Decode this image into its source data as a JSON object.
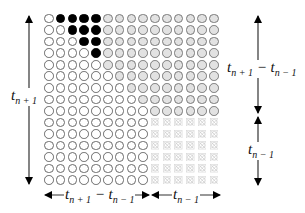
{
  "diagram": {
    "grid": {
      "rows": 15,
      "cols": 15,
      "black_cells": [
        [
          0,
          1
        ],
        [
          0,
          2
        ],
        [
          0,
          3
        ],
        [
          0,
          4
        ],
        [
          1,
          2
        ],
        [
          1,
          3
        ],
        [
          1,
          4
        ],
        [
          2,
          3
        ],
        [
          2,
          4
        ],
        [
          3,
          4
        ]
      ],
      "gray_region": "row r: columns max(r+1,5)..14 for rows 0-8",
      "crossed_region": {
        "rows": [
          9,
          14
        ],
        "cols": [
          9,
          14
        ]
      },
      "colors": {
        "circle_stroke": "#6a6a6a",
        "gray_fill": "#e2e2e2",
        "black_fill": "#000000",
        "cross": "#c8c8c8"
      }
    },
    "labels": {
      "left_vertical": {
        "base": "t",
        "sub": "n + 1"
      },
      "right_upper": {
        "base1": "t",
        "sub1": "n + 1",
        "minus": " − ",
        "base2": "t",
        "sub2": "n − 1"
      },
      "right_lower": {
        "base": "t",
        "sub": "n − 1"
      },
      "bottom_left": {
        "base1": "t",
        "sub1": "n + 1",
        "minus": " − ",
        "base2": "t",
        "sub2": "n − 1"
      },
      "bottom_right": {
        "base": "t",
        "sub": "n − 1"
      }
    }
  }
}
